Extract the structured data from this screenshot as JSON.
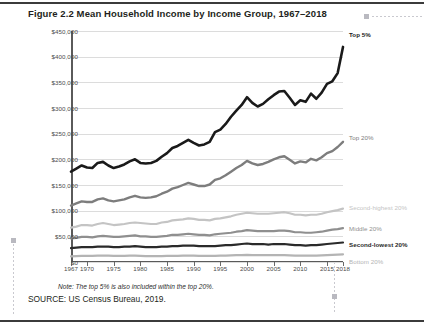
{
  "figure": {
    "title": "Figure 2.2  Mean Household Income by Income Group, 1967–2018",
    "note": "Note: The top 5% is also included within the top 20%.",
    "source": "SOURCE: US Census Bureau, 2019."
  },
  "chart_data": {
    "type": "line",
    "title": "Figure 2.2  Mean Household Income by Income Group, 1967–2018",
    "xlabel": "",
    "ylabel": "MEAN HOUSEHOLD INCOME IN 2018 DOLLARS",
    "xlim": [
      1967,
      2018
    ],
    "ylim": [
      0,
      450000
    ],
    "grid": true,
    "legend_position": "right-inline-labels",
    "ytick_labels": [
      "$0",
      "$50,000",
      "$100,000",
      "$150,000",
      "$200,000",
      "$250,000",
      "$300,000",
      "$350,000",
      "$400,000",
      "$450,000"
    ],
    "ytick_values": [
      0,
      50000,
      100000,
      150000,
      200000,
      250000,
      300000,
      350000,
      400000,
      450000
    ],
    "xtick_labels": [
      "1967",
      "1970",
      "1975",
      "1980",
      "1985",
      "1990",
      "1995",
      "2000",
      "2005",
      "2010",
      "2015",
      "2018"
    ],
    "xtick_values": [
      1967,
      1970,
      1975,
      1980,
      1985,
      1990,
      1995,
      2000,
      2005,
      2010,
      2015,
      2018
    ],
    "x": [
      1967,
      1968,
      1969,
      1970,
      1971,
      1972,
      1973,
      1974,
      1975,
      1976,
      1977,
      1978,
      1979,
      1980,
      1981,
      1982,
      1983,
      1984,
      1985,
      1986,
      1987,
      1988,
      1989,
      1990,
      1991,
      1992,
      1993,
      1994,
      1995,
      1996,
      1997,
      1998,
      1999,
      2000,
      2001,
      2002,
      2003,
      2004,
      2005,
      2006,
      2007,
      2008,
      2009,
      2010,
      2011,
      2012,
      2013,
      2014,
      2015,
      2016,
      2017,
      2018
    ],
    "series": [
      {
        "name": "Top 5%",
        "color": "#1a1a1a",
        "label": "Top 5%",
        "values": [
          176000,
          182000,
          188000,
          184000,
          183000,
          193000,
          195000,
          188000,
          183000,
          186000,
          190000,
          196000,
          200000,
          193000,
          192000,
          193000,
          197000,
          205000,
          212000,
          222000,
          226000,
          232000,
          238000,
          232000,
          227000,
          229000,
          234000,
          253000,
          258000,
          269000,
          283000,
          295000,
          306000,
          321000,
          310000,
          303000,
          308000,
          317000,
          325000,
          332000,
          333000,
          320000,
          306000,
          315000,
          312000,
          328000,
          318000,
          330000,
          347000,
          352000,
          368000,
          419000
        ]
      },
      {
        "name": "Top 20%",
        "color": "#7d7d7d",
        "label": "Top 20%",
        "values": [
          110000,
          114000,
          118000,
          117000,
          117000,
          122000,
          124000,
          120000,
          118000,
          120000,
          122000,
          126000,
          129000,
          126000,
          125000,
          126000,
          128000,
          133000,
          137000,
          143000,
          146000,
          150000,
          154000,
          151000,
          148000,
          148000,
          151000,
          160000,
          163000,
          169000,
          176000,
          183000,
          189000,
          197000,
          192000,
          189000,
          191000,
          195000,
          200000,
          204000,
          206000,
          199000,
          192000,
          196000,
          194000,
          201000,
          198000,
          204000,
          212000,
          216000,
          224000,
          234000
        ]
      },
      {
        "name": "Second-highest 20%",
        "color": "#c4c4c4",
        "label": "Second-highest 20%",
        "values": [
          67000,
          69000,
          72000,
          72000,
          71000,
          74000,
          76000,
          74000,
          72000,
          73000,
          74000,
          76000,
          77000,
          76000,
          75000,
          74000,
          74000,
          77000,
          78000,
          81000,
          82000,
          83000,
          85000,
          84000,
          82000,
          82000,
          81000,
          84000,
          85000,
          87000,
          89000,
          92000,
          94000,
          96000,
          95000,
          94000,
          94000,
          94000,
          95000,
          96000,
          97000,
          95000,
          92000,
          92000,
          91000,
          92000,
          92000,
          94000,
          97000,
          99000,
          101000,
          104000
        ]
      },
      {
        "name": "Middle 20%",
        "color": "#8f8f8f",
        "label": "Middle 20%",
        "values": [
          46000,
          47000,
          49000,
          49000,
          48000,
          50000,
          51000,
          50000,
          49000,
          49000,
          50000,
          51000,
          52000,
          50000,
          50000,
          49000,
          49000,
          50000,
          51000,
          53000,
          53000,
          54000,
          55000,
          54000,
          53000,
          53000,
          52000,
          54000,
          55000,
          56000,
          57000,
          59000,
          60000,
          62000,
          61000,
          60000,
          60000,
          60000,
          60000,
          61000,
          61000,
          60000,
          58000,
          58000,
          57000,
          57000,
          58000,
          59000,
          61000,
          63000,
          64000,
          66000
        ]
      },
      {
        "name": "Second-lowest 20%",
        "color": "#2a2a2a",
        "label": "Second-lowest 20%",
        "values": [
          27000,
          28000,
          29000,
          29000,
          29000,
          30000,
          30000,
          30000,
          29000,
          29000,
          30000,
          30000,
          31000,
          30000,
          29000,
          29000,
          29000,
          30000,
          30000,
          31000,
          31000,
          32000,
          32000,
          32000,
          31000,
          31000,
          31000,
          31000,
          32000,
          33000,
          33000,
          34000,
          35000,
          36000,
          35000,
          35000,
          35000,
          34000,
          35000,
          35000,
          35000,
          34000,
          33000,
          33000,
          32000,
          33000,
          33000,
          34000,
          35000,
          36000,
          37000,
          38000
        ]
      },
      {
        "name": "Bottom 20%",
        "color": "#b4b4b4",
        "label": "Bottom 20%",
        "values": [
          11000,
          11500,
          12000,
          12000,
          12000,
          12500,
          12500,
          12500,
          12000,
          12000,
          12000,
          12500,
          12500,
          12000,
          11500,
          11500,
          11500,
          11500,
          12000,
          12000,
          12000,
          12500,
          12500,
          12500,
          12000,
          12000,
          12000,
          12000,
          12500,
          12500,
          13000,
          13500,
          13500,
          14000,
          13500,
          13500,
          13500,
          13500,
          13500,
          13500,
          13500,
          13000,
          12500,
          12500,
          12500,
          12500,
          12500,
          13000,
          13500,
          14000,
          14500,
          15000
        ]
      }
    ]
  }
}
